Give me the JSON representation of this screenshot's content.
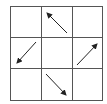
{
  "diagram": {
    "type": "3x3 grid with direction arrows",
    "rows": 3,
    "cols": 3,
    "grid_color": "#555555",
    "arrow_color": "#222222",
    "cells": [
      {
        "row": 0,
        "col": 0,
        "arrow": null
      },
      {
        "row": 0,
        "col": 1,
        "arrow": "up-left"
      },
      {
        "row": 0,
        "col": 2,
        "arrow": null
      },
      {
        "row": 1,
        "col": 0,
        "arrow": "down-left"
      },
      {
        "row": 1,
        "col": 1,
        "arrow": null
      },
      {
        "row": 1,
        "col": 2,
        "arrow": "up-right"
      },
      {
        "row": 2,
        "col": 0,
        "arrow": null
      },
      {
        "row": 2,
        "col": 1,
        "arrow": "down-right"
      },
      {
        "row": 2,
        "col": 2,
        "arrow": null
      }
    ]
  }
}
